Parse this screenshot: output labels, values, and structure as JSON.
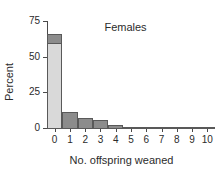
{
  "chart_data": {
    "type": "bar",
    "title": "Females",
    "xlabel": "No. offspring weaned",
    "ylabel": "Percent",
    "categories": [
      "0",
      "1",
      "2",
      "3",
      "4",
      "5",
      "6",
      "7",
      "8",
      "9",
      "10"
    ],
    "values": [
      66,
      12,
      7.5,
      6,
      2.5,
      1.5,
      0.8,
      0.8,
      0.5,
      1.5,
      0.4
    ],
    "segments": {
      "note": "first bar drawn as light body with darker cap",
      "bar0_body_top": 59,
      "bar0_total": 66
    },
    "ylim": [
      0,
      75
    ],
    "yticks": [
      0,
      25,
      50,
      75
    ],
    "yticklabels": [
      "0",
      "25",
      "50",
      "75"
    ],
    "xticklabels": [
      "0",
      "1",
      "2",
      "3",
      "4",
      "5",
      "6",
      "7",
      "8",
      "9",
      "10"
    ],
    "grid": false,
    "legend": false,
    "colors": {
      "bar_fill": "#8c8c8c",
      "bar_fill_light": "#d9d9d9",
      "bar_edge": "#595959",
      "axis": "#4a4a4a",
      "text": "#2b2b2b",
      "background": "#ffffff"
    }
  }
}
